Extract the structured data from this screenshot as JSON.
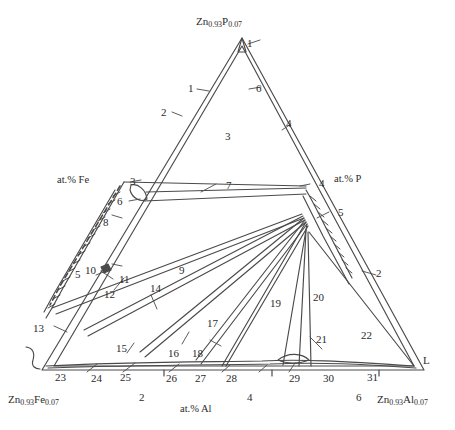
{
  "figure": {
    "type": "ternary-phase-diagram"
  },
  "corners": {
    "top": {
      "base1": "Zn",
      "sub1": "0.93",
      "base2": "P",
      "sub2": "0.07"
    },
    "bottom_left": {
      "base1": "Zn",
      "sub1": "0.93",
      "base2": "Fe",
      "sub2": "0.07"
    },
    "bottom_right": {
      "base1": "Zn",
      "sub1": "0.93",
      "base2": "Al",
      "sub2": "0.07"
    }
  },
  "axes": {
    "left_label": "at.% Fe",
    "right_label": "at.% P",
    "bottom_label": "at.% Al",
    "bottom_ticks": [
      "2",
      "4",
      "6"
    ]
  },
  "liquid_label": "L",
  "field_numbers": [
    {
      "id": "n1a",
      "text": "1"
    },
    {
      "id": "n1b",
      "text": "1"
    },
    {
      "id": "n2a",
      "text": "2"
    },
    {
      "id": "n3a",
      "text": "3"
    },
    {
      "id": "n3b",
      "text": "3"
    },
    {
      "id": "n4a",
      "text": "4"
    },
    {
      "id": "n4b",
      "text": "4"
    },
    {
      "id": "n5a",
      "text": "5"
    },
    {
      "id": "n5b",
      "text": "5"
    },
    {
      "id": "n6a",
      "text": "6"
    },
    {
      "id": "n6b",
      "text": "6"
    },
    {
      "id": "n7",
      "text": "7"
    },
    {
      "id": "n8",
      "text": "8"
    },
    {
      "id": "n9",
      "text": "9"
    },
    {
      "id": "n10",
      "text": "10"
    },
    {
      "id": "n11",
      "text": "11"
    },
    {
      "id": "n12",
      "text": "12"
    },
    {
      "id": "n13",
      "text": "13"
    },
    {
      "id": "n14",
      "text": "14"
    },
    {
      "id": "n15",
      "text": "15"
    },
    {
      "id": "n16",
      "text": "16"
    },
    {
      "id": "n17",
      "text": "17"
    },
    {
      "id": "n18",
      "text": "18"
    },
    {
      "id": "n19",
      "text": "19"
    },
    {
      "id": "n20",
      "text": "20"
    },
    {
      "id": "n21",
      "text": "21"
    },
    {
      "id": "n22",
      "text": "22"
    },
    {
      "id": "n2b",
      "text": "2"
    },
    {
      "id": "n23",
      "text": "23"
    },
    {
      "id": "n24",
      "text": "24"
    },
    {
      "id": "n25",
      "text": "25"
    },
    {
      "id": "n26",
      "text": "26"
    },
    {
      "id": "n27",
      "text": "27"
    },
    {
      "id": "n28",
      "text": "28"
    },
    {
      "id": "n29",
      "text": "29"
    },
    {
      "id": "n30",
      "text": "30"
    },
    {
      "id": "n31",
      "text": "31"
    }
  ],
  "colors": {
    "line": "#4a4a4a",
    "text": "#2b2b2b",
    "background": "#ffffff"
  }
}
